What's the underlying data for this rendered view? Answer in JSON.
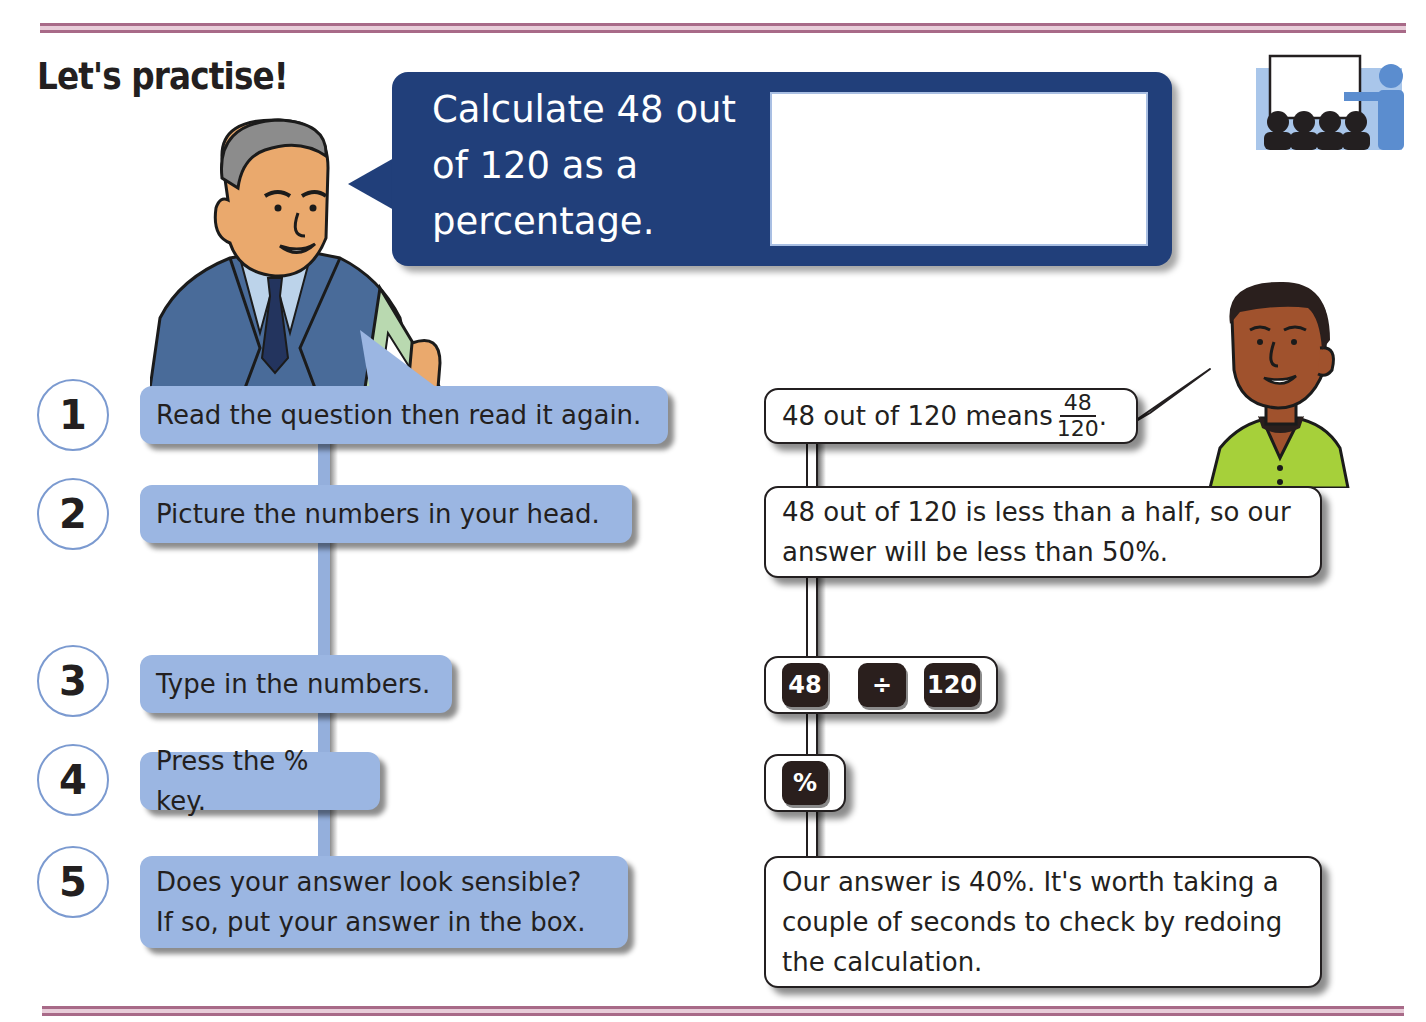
{
  "page": {
    "title": "Let's practise!",
    "colors": {
      "rule": "#a86a88",
      "question_bg": "#213f7a",
      "step_box_bg": "#9bb6e2",
      "step_circle_border": "#7b9ad0",
      "calculator_key": "#2a1f1d",
      "text": "#231f20"
    }
  },
  "question": {
    "text": "Calculate 48 out of 120 as a percentage.",
    "lines": [
      "Calculate 48 out",
      "of 120 as a",
      "percentage."
    ],
    "answer_box_value": ""
  },
  "icon": {
    "name": "classroom-whiteboard-icon"
  },
  "steps": [
    {
      "number": "1",
      "lines": [
        "Read the question then read it again."
      ]
    },
    {
      "number": "2",
      "lines": [
        "Picture the numbers in your head."
      ]
    },
    {
      "number": "3",
      "lines": [
        "Type in the numbers."
      ]
    },
    {
      "number": "4",
      "lines": [
        "Press the % key."
      ]
    },
    {
      "number": "5",
      "lines": [
        "Does your answer look sensible?",
        "If so, put your answer in the box."
      ]
    }
  ],
  "worked": {
    "step1": {
      "text": "48 out of 120 means",
      "fraction_numerator": "48",
      "fraction_denominator": "120",
      "suffix": "."
    },
    "step2": {
      "lines": [
        "48 out of 120 is less than a half, so our",
        "answer will be less than 50%."
      ]
    },
    "step3": {
      "keys": [
        "48",
        "÷",
        "120"
      ]
    },
    "step4": {
      "keys": [
        "%"
      ]
    },
    "step5": {
      "lines": [
        "Our answer is 40%. It's worth taking a",
        "couple of seconds to check by redoing",
        "the calculation."
      ]
    }
  }
}
